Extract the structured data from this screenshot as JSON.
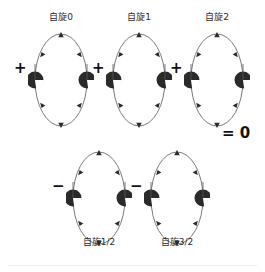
{
  "figure": {
    "background_color": "#ffffff",
    "stroke_color": "#5a5a5a",
    "sphere_color": "#262626",
    "text_color": "#2b2b2b",
    "sign_color": "#111111",
    "result_text": "= 0"
  },
  "terms": [
    {
      "id": "spin-0",
      "label": "自旋0",
      "sign": "+",
      "label_position": "top",
      "row": "top",
      "x": 28,
      "y": 30
    },
    {
      "id": "spin-1",
      "label": "自旋1",
      "sign": "+",
      "label_position": "top",
      "row": "top",
      "x": 106,
      "y": 30
    },
    {
      "id": "spin-2",
      "label": "自旋2",
      "sign": "+",
      "label_position": "top",
      "row": "top",
      "x": 184,
      "y": 30
    },
    {
      "id": "spin-1-2",
      "label": "自旋1/2",
      "sign": "−",
      "label_position": "bottom",
      "row": "bottom",
      "x": 66,
      "y": 148
    },
    {
      "id": "spin-3-2",
      "label": "自旋3/2",
      "sign": "−",
      "label_position": "bottom",
      "row": "bottom",
      "x": 144,
      "y": 148
    }
  ],
  "diagram_geometry": {
    "ellipse_rx": 26,
    "ellipse_ry": 48,
    "sphere_radius": 9,
    "arrow_markers": 6
  }
}
